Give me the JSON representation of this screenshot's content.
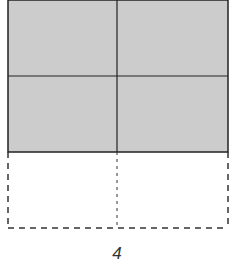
{
  "diagram": {
    "shaded_rows": 2,
    "dashed_rows": 1,
    "columns": 2,
    "colors": {
      "fill": "#cccccc",
      "stroke": "#222222",
      "dashed_stroke": "#333333"
    },
    "bottom_label": "4"
  }
}
